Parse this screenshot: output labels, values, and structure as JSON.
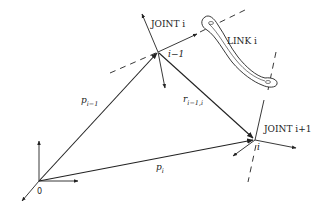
{
  "diagram": {
    "labels": {
      "joint_i": "JOINT  i",
      "joint_i_plus_1": "JOINT  i+1",
      "link_i": "LINK  i",
      "frame_i_minus_1": "i−1",
      "frame_i": "i",
      "origin": "0",
      "p_prev_main": "p",
      "p_prev_sub": "i−1",
      "r_main": "r",
      "r_sub": "i−1,i",
      "p_i_main": "p",
      "p_i_sub": "i"
    },
    "nodes": [
      {
        "id": "origin",
        "x": 39,
        "y": 181
      },
      {
        "id": "frame_i_minus_1",
        "x": 158,
        "y": 52
      },
      {
        "id": "frame_i",
        "x": 255,
        "y": 140
      }
    ],
    "vectors": [
      {
        "id": "p_i_minus_1",
        "from": "origin",
        "to": "frame_i_minus_1"
      },
      {
        "id": "r_i_minus_1_i",
        "from": "frame_i_minus_1",
        "to": "frame_i"
      },
      {
        "id": "p_i",
        "from": "origin",
        "to": "frame_i"
      }
    ],
    "colors": {
      "stroke": "#222222",
      "background": "#ffffff"
    }
  }
}
